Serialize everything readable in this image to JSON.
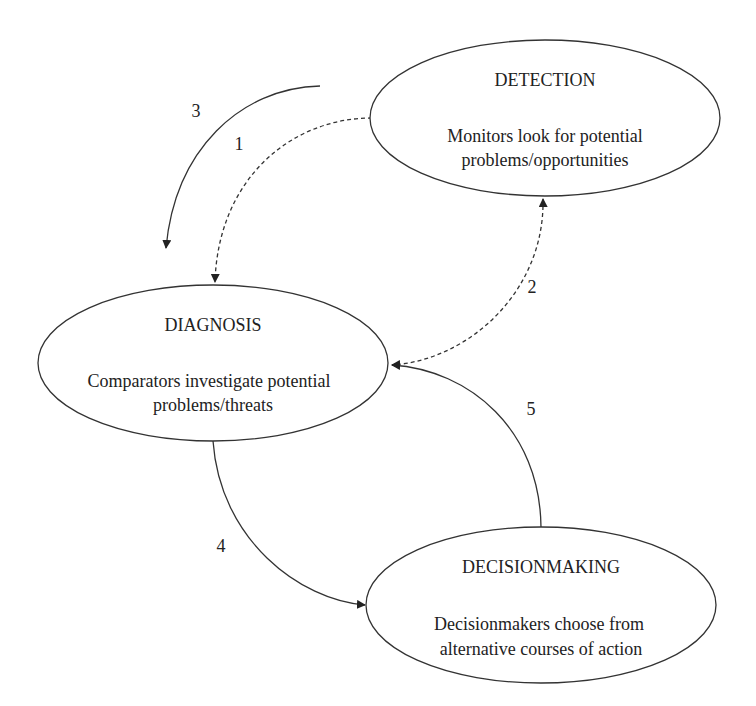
{
  "diagram": {
    "type": "cycle",
    "colors": {
      "stroke": "#333333",
      "text": "#222222",
      "background": "#ffffff"
    },
    "nodes": [
      {
        "id": "detection",
        "title": "DETECTION",
        "description_lines": [
          "Monitors look for potential",
          "problems/opportunities"
        ]
      },
      {
        "id": "diagnosis",
        "title": "DIAGNOSIS",
        "description_lines": [
          "Comparators investigate potential",
          "problems/threats"
        ]
      },
      {
        "id": "decisionmaking",
        "title": "DECISIONMAKING",
        "description_lines": [
          "Decisionmakers choose from",
          "alternative courses of action"
        ]
      }
    ],
    "edges": [
      {
        "label": "1",
        "from": "detection",
        "to": "diagnosis",
        "style": "dashed"
      },
      {
        "label": "2",
        "from": "diagnosis",
        "to": "detection",
        "style": "dashed",
        "bidirectional": true
      },
      {
        "label": "3",
        "from": "outside",
        "to": "diagnosis",
        "style": "solid"
      },
      {
        "label": "4",
        "from": "diagnosis",
        "to": "decisionmaking",
        "style": "solid"
      },
      {
        "label": "5",
        "from": "decisionmaking",
        "to": "diagnosis",
        "style": "solid"
      }
    ]
  }
}
